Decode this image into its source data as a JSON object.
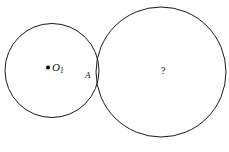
{
  "figure": {
    "background_color": "#ffffff",
    "stroke_color": "#1a1a1a",
    "text_color": "#111111",
    "width": 229,
    "height": 152,
    "circles": [
      {
        "id": "left-circle",
        "name": "circle-o1",
        "cx": 52,
        "cy": 70.5,
        "r": 47,
        "stroke": "#1a1a1a",
        "stroke_width": 1,
        "fill": "none"
      },
      {
        "id": "right-circle",
        "name": "circle-unknown",
        "cx": 161,
        "cy": 72,
        "r": 65,
        "stroke": "#1a1a1a",
        "stroke_width": 1,
        "fill": "none"
      }
    ],
    "points": [
      {
        "id": "center-o1",
        "name": "center-point-o1",
        "cx": 48,
        "cy": 67.5,
        "r": 2,
        "fill": "#000000"
      }
    ],
    "labels": {
      "center_o1": {
        "base": "O",
        "subscript": "1",
        "x": 52,
        "y": 62
      },
      "tangent_point": {
        "text": "A",
        "x": 85,
        "y": 71
      },
      "unknown_circle": {
        "text": "?",
        "x": 161,
        "y": 66
      }
    }
  }
}
